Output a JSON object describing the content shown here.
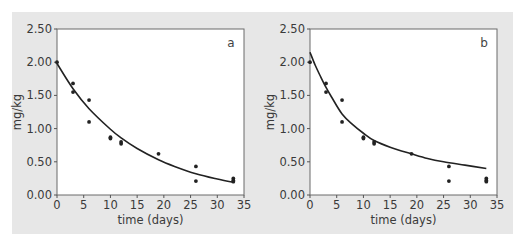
{
  "figure": {
    "background_color": "#e7e7e7",
    "plot_background": "#ffffff"
  },
  "chart_data": [
    {
      "type": "scatter",
      "panel_label": "a",
      "title": "",
      "xlabel": "time (days)",
      "ylabel": "mg/kg",
      "xlim": [
        0,
        35
      ],
      "ylim": [
        0,
        2.5
      ],
      "x_ticks": [
        "0",
        "5",
        "10",
        "15",
        "20",
        "25",
        "30",
        "35"
      ],
      "y_ticks": [
        "0.00",
        "0.50",
        "1.00",
        "1.50",
        "2.00",
        "2.50"
      ],
      "grid": false,
      "series": [
        {
          "name": "observed",
          "kind": "scatter",
          "points": [
            [
              0,
              2.0
            ],
            [
              3,
              1.68
            ],
            [
              3,
              1.55
            ],
            [
              6,
              1.43
            ],
            [
              6,
              1.1
            ],
            [
              10,
              0.87
            ],
            [
              10,
              0.85
            ],
            [
              12,
              0.8
            ],
            [
              12,
              0.77
            ],
            [
              19,
              0.62
            ],
            [
              26,
              0.43
            ],
            [
              26,
              0.21
            ],
            [
              33,
              0.25
            ],
            [
              33,
              0.22
            ],
            [
              33,
              0.2
            ]
          ]
        },
        {
          "name": "fitted",
          "kind": "line",
          "points": [
            [
              0,
              1.98
            ],
            [
              3,
              1.6
            ],
            [
              6,
              1.3
            ],
            [
              10,
              0.99
            ],
            [
              12,
              0.86
            ],
            [
              15,
              0.7
            ],
            [
              19,
              0.53
            ],
            [
              22,
              0.43
            ],
            [
              26,
              0.32
            ],
            [
              30,
              0.24
            ],
            [
              33,
              0.19
            ]
          ]
        }
      ]
    },
    {
      "type": "scatter",
      "panel_label": "b",
      "title": "",
      "xlabel": "time (days)",
      "ylabel": "mg/kg",
      "xlim": [
        0,
        35
      ],
      "ylim": [
        0,
        2.5
      ],
      "x_ticks": [
        "0",
        "5",
        "10",
        "15",
        "20",
        "25",
        "30",
        "35"
      ],
      "y_ticks": [
        "0.00",
        "0.50",
        "1.00",
        "1.50",
        "2.00",
        "2.50"
      ],
      "grid": false,
      "series": [
        {
          "name": "observed",
          "kind": "scatter",
          "points": [
            [
              0,
              2.0
            ],
            [
              3,
              1.68
            ],
            [
              3,
              1.55
            ],
            [
              6,
              1.43
            ],
            [
              6,
              1.1
            ],
            [
              10,
              0.87
            ],
            [
              10,
              0.85
            ],
            [
              12,
              0.8
            ],
            [
              12,
              0.77
            ],
            [
              19,
              0.62
            ],
            [
              26,
              0.43
            ],
            [
              26,
              0.21
            ],
            [
              33,
              0.25
            ],
            [
              33,
              0.22
            ],
            [
              33,
              0.2
            ]
          ]
        },
        {
          "name": "fitted",
          "kind": "line",
          "points": [
            [
              0,
              2.15
            ],
            [
              1,
              1.95
            ],
            [
              2,
              1.78
            ],
            [
              3,
              1.62
            ],
            [
              4,
              1.48
            ],
            [
              6,
              1.22
            ],
            [
              8,
              1.06
            ],
            [
              10,
              0.93
            ],
            [
              12,
              0.82
            ],
            [
              15,
              0.72
            ],
            [
              19,
              0.62
            ],
            [
              22,
              0.55
            ],
            [
              25,
              0.5
            ],
            [
              29,
              0.45
            ],
            [
              33,
              0.4
            ]
          ]
        }
      ]
    }
  ]
}
